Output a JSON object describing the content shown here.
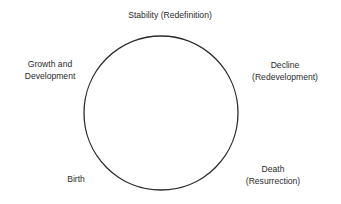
{
  "diagram": {
    "type": "cycle",
    "shape": "circle",
    "circle": {
      "cx": 161,
      "cy": 113,
      "r": 77,
      "stroke": "#2b2b2b",
      "fill": "#ffffff"
    },
    "stages": [
      {
        "id": "stability",
        "lines": [
          "Stability (Redefinition)"
        ]
      },
      {
        "id": "growth",
        "lines": [
          "Growth and",
          "Development"
        ]
      },
      {
        "id": "decline",
        "lines": [
          "Decline",
          "(Redevelopment)"
        ]
      },
      {
        "id": "death",
        "lines": [
          "Death",
          "(Resurrection)"
        ]
      },
      {
        "id": "birth",
        "lines": [
          "Birth"
        ]
      }
    ]
  }
}
